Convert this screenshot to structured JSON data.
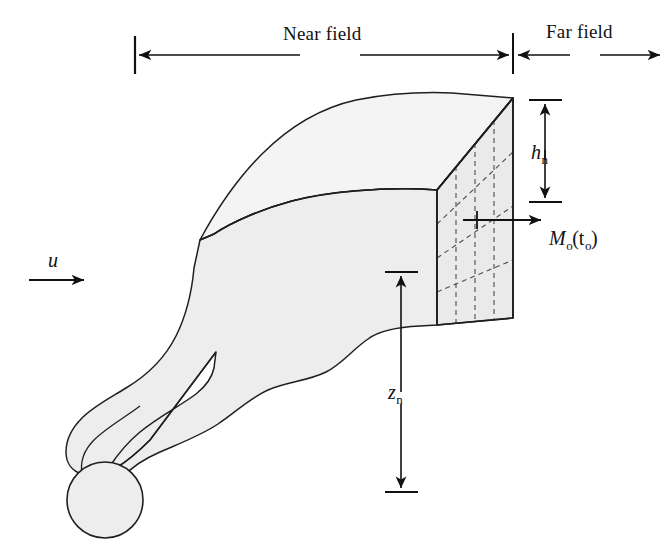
{
  "figure": {
    "type": "technical-schematic",
    "background_color": "#ffffff",
    "line_color": "#1a1a1a",
    "plume_fill_top": "#f3f3f3",
    "plume_fill_front": "#ededed",
    "box_face_fill": "#ebebeb",
    "dashed_grid_color": "#555555"
  },
  "labels": {
    "near_field": "Near field",
    "far_field": "Far field",
    "wind_speed": "u",
    "plume_height_main": "h",
    "plume_height_sub": "n",
    "plume_rise_main": "z",
    "plume_rise_sub": "n",
    "mass_flux_main": "M",
    "mass_flux_sub1": "o",
    "mass_flux_paren_open": "(t",
    "mass_flux_sub2": "o",
    "mass_flux_paren_close": ")"
  },
  "annotations": {
    "near_field_arrow": "double-headed horizontal span arrow from left boundary tick to near/far field divider",
    "far_field_arrow": "horizontal arrow from divider extending right beyond figure edge",
    "wind_arrow": "single right-pointing arrow indicating ambient wind direction u",
    "height_dimension": "vertical double-headed arrow measuring plume slab height h_n",
    "rise_dimension": "vertical double-headed arrow measuring plume centerline rise z_n from ground",
    "flux_arrow": "horizontal right-pointing arrow from cross-section face denoting mass flux M_o(t_o)"
  },
  "geometry": {
    "divider_x": 513,
    "left_tick_x": 135,
    "near_field_arrow_y": 55,
    "box_top_right": [
      513,
      98
    ],
    "box_bottom_right": [
      513,
      318
    ],
    "box_front_left_top": [
      437,
      190
    ],
    "box_front_left_bottom": [
      437,
      325
    ],
    "stack_center": [
      105,
      500
    ],
    "stack_radius": 38,
    "grid_vertical_lines": 3,
    "grid_diagonal_lines": 3
  }
}
